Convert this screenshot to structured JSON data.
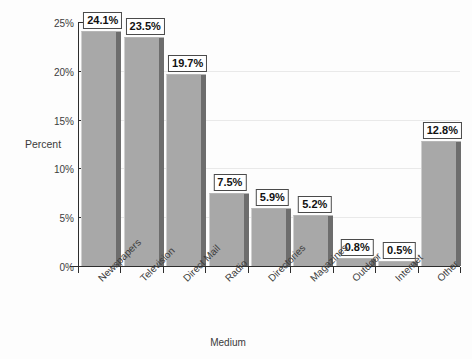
{
  "chart_data": {
    "type": "bar",
    "title": "",
    "xlabel": "Medium",
    "ylabel": "Percent",
    "ylim": [
      0,
      25
    ],
    "ytick_labels": [
      "0%",
      "5%",
      "10%",
      "15%",
      "20%",
      "25%"
    ],
    "ytick_values": [
      0,
      5,
      10,
      15,
      20,
      25
    ],
    "grid": true,
    "gridlines_at": [
      5,
      10,
      15,
      20
    ],
    "legend": null,
    "categories": [
      "Newspapers",
      "Television",
      "Direct Mail",
      "Radio",
      "Directories",
      "Magazines",
      "Outdoor",
      "Internet",
      "Other"
    ],
    "values": [
      24.1,
      23.5,
      19.7,
      7.5,
      5.9,
      5.2,
      0.8,
      0.5,
      12.8
    ],
    "data_labels": [
      "24.1%",
      "23.5%",
      "19.7%",
      "7.5%",
      "5.9%",
      "5.2%",
      "0.8%",
      "0.5%",
      "12.8%"
    ],
    "bar_fill_color": "#a8a8a8",
    "bar_shadow_color": "#6d6d6d",
    "axis_color": "#2d2d2d",
    "gridline_color": "#e9e9e9",
    "background_color": "#fdfdfd"
  }
}
